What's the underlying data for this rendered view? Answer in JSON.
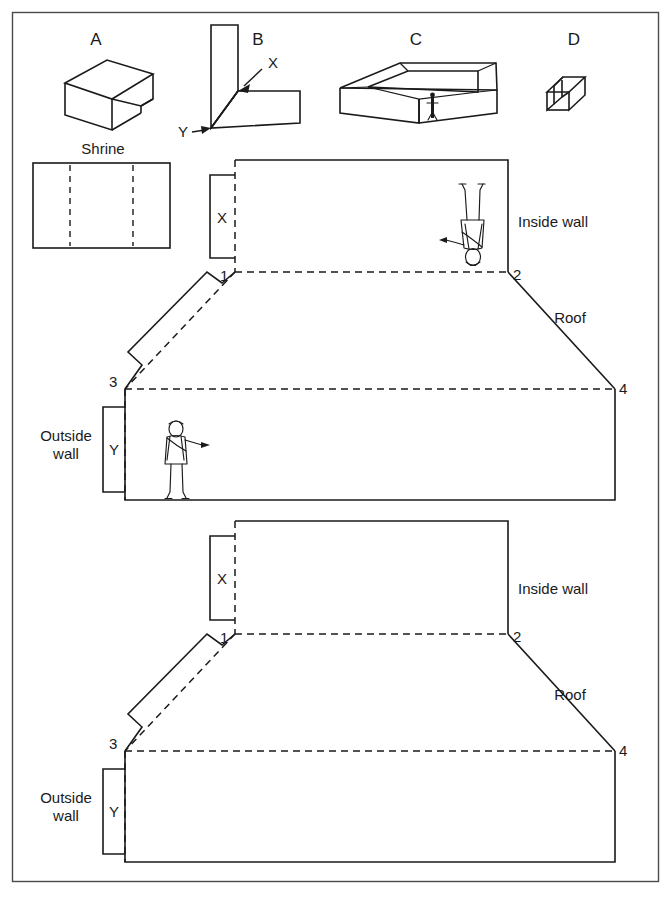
{
  "figure": {
    "title": "",
    "top_row": {
      "items": [
        {
          "id": "A",
          "label": "A",
          "name": "shape-a-slab-with-notch"
        },
        {
          "id": "B",
          "label": "B",
          "name": "shape-b-corner-fold"
        },
        {
          "id": "C",
          "label": "C",
          "name": "shape-c-open-tray"
        },
        {
          "id": "D",
          "label": "D",
          "name": "shape-d-channel"
        }
      ],
      "b_markers": [
        {
          "label": "X",
          "name": "marker-x-inner-corner"
        },
        {
          "label": "Y",
          "name": "marker-y-outer-corner"
        }
      ]
    },
    "shrine": {
      "label": "Shrine",
      "divisions": 3
    },
    "diagrams": [
      {
        "name": "unfolded-net-upper",
        "has_figures": true,
        "labels": {
          "inside_wall": "Inside wall",
          "outside_wall_line1": "Outside",
          "outside_wall_line2": "wall",
          "roof": "Roof",
          "tab_x": "X",
          "tab_y": "Y",
          "corner_1": "1",
          "corner_2": "2",
          "corner_3": "3",
          "corner_4": "4"
        },
        "figures": [
          {
            "name": "human-figure-inverted-inside-wall",
            "orientation": "inverted"
          },
          {
            "name": "human-figure-standing-outside-wall",
            "orientation": "upright"
          }
        ]
      },
      {
        "name": "unfolded-net-lower",
        "has_figures": false,
        "labels": {
          "inside_wall": "Inside wall",
          "outside_wall_line1": "Outside",
          "outside_wall_line2": "wall",
          "roof": "Roof",
          "tab_x": "X",
          "tab_y": "Y",
          "corner_1": "1",
          "corner_2": "2",
          "corner_3": "3",
          "corner_4": "4"
        },
        "figures": []
      }
    ],
    "colors": {
      "ink": "#1a1a1a",
      "frame": "#4a4a4a",
      "background": "#ffffff"
    }
  }
}
